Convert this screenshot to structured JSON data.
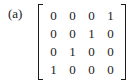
{
  "label": "(a)",
  "matrix": {
    "rows": [
      [
        "0",
        "0",
        "0",
        "1"
      ],
      [
        "0",
        "0",
        "1",
        "0"
      ],
      [
        "0",
        "1",
        "0",
        "0"
      ],
      [
        "1",
        "0",
        "0",
        "0"
      ]
    ]
  }
}
